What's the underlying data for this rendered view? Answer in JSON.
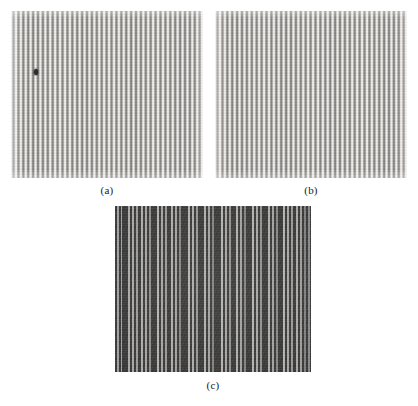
{
  "figure": {
    "background_color": "#ffffff",
    "width": 418,
    "height": 406,
    "panels": [
      {
        "id": "a",
        "caption": "(a)",
        "kind": "vertical-line-grating",
        "description": "Regular vertical grating of mid-gray bars on light ground with a single small dark point defect.",
        "x": 11,
        "y": 11,
        "width": 192,
        "height": 167,
        "stripe_period_px": 4.9,
        "bar_color": "#8a8886",
        "gap_color": "#f0eeea",
        "defect": {
          "present": true,
          "x": 23,
          "y": 58,
          "width": 4,
          "height": 6,
          "color": "#2c2c2c"
        }
      },
      {
        "id": "b",
        "caption": "(b)",
        "kind": "vertical-line-grating",
        "description": "Same regular vertical grating without the point defect.",
        "x": 215,
        "y": 11,
        "width": 192,
        "height": 167,
        "stripe_period_px": 4.9,
        "bar_color": "#8a8886",
        "gap_color": "#f0eeea",
        "defect": {
          "present": false
        }
      },
      {
        "id": "c",
        "caption": "(c)",
        "kind": "moire-beat-pattern",
        "description": "Dark field crossed by irregularly clustered thin bright vertical lines forming a moire beat.",
        "x": 115,
        "y": 206,
        "width": 196,
        "height": 166,
        "field_color": "#3b3b3b",
        "line_color": "#f2f0ec"
      }
    ]
  },
  "panel_c_lines": [
    {
      "x": 2,
      "w": 2.0,
      "a": 0.85
    },
    {
      "x": 6,
      "w": 1.4,
      "a": 0.55
    },
    {
      "x": 13,
      "w": 2.2,
      "a": 0.92
    },
    {
      "x": 17,
      "w": 2.0,
      "a": 0.9
    },
    {
      "x": 21,
      "w": 1.8,
      "a": 0.8
    },
    {
      "x": 26,
      "w": 2.2,
      "a": 0.95
    },
    {
      "x": 30,
      "w": 2.0,
      "a": 0.88
    },
    {
      "x": 34,
      "w": 1.6,
      "a": 0.7
    },
    {
      "x": 42,
      "w": 2.4,
      "a": 1.0
    },
    {
      "x": 46,
      "w": 2.0,
      "a": 0.88
    },
    {
      "x": 50,
      "w": 1.8,
      "a": 0.78
    },
    {
      "x": 56,
      "w": 2.2,
      "a": 0.95
    },
    {
      "x": 60,
      "w": 2.0,
      "a": 0.86
    },
    {
      "x": 64,
      "w": 1.5,
      "a": 0.62
    },
    {
      "x": 73,
      "w": 2.4,
      "a": 1.0
    },
    {
      "x": 77,
      "w": 2.2,
      "a": 0.94
    },
    {
      "x": 81,
      "w": 1.8,
      "a": 0.76
    },
    {
      "x": 89,
      "w": 2.3,
      "a": 0.96
    },
    {
      "x": 93,
      "w": 2.0,
      "a": 0.86
    },
    {
      "x": 97,
      "w": 1.5,
      "a": 0.6
    },
    {
      "x": 106,
      "w": 2.4,
      "a": 1.0
    },
    {
      "x": 110,
      "w": 2.0,
      "a": 0.88
    },
    {
      "x": 114,
      "w": 1.7,
      "a": 0.72
    },
    {
      "x": 121,
      "w": 2.3,
      "a": 0.96
    },
    {
      "x": 125,
      "w": 2.0,
      "a": 0.86
    },
    {
      "x": 129,
      "w": 1.5,
      "a": 0.6
    },
    {
      "x": 137,
      "w": 2.4,
      "a": 1.0
    },
    {
      "x": 141,
      "w": 2.1,
      "a": 0.9
    },
    {
      "x": 145,
      "w": 1.7,
      "a": 0.72
    },
    {
      "x": 153,
      "w": 2.3,
      "a": 0.96
    },
    {
      "x": 157,
      "w": 2.0,
      "a": 0.86
    },
    {
      "x": 161,
      "w": 1.6,
      "a": 0.64
    },
    {
      "x": 168,
      "w": 2.4,
      "a": 1.0
    },
    {
      "x": 172,
      "w": 2.1,
      "a": 0.9
    },
    {
      "x": 176,
      "w": 1.8,
      "a": 0.78
    },
    {
      "x": 181,
      "w": 2.2,
      "a": 0.92
    },
    {
      "x": 185,
      "w": 1.9,
      "a": 0.82
    },
    {
      "x": 189,
      "w": 1.5,
      "a": 0.58
    },
    {
      "x": 193,
      "w": 1.6,
      "a": 0.66
    }
  ]
}
